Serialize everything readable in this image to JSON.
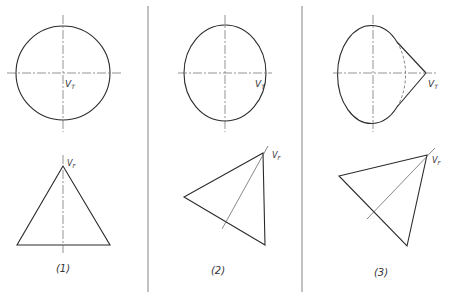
{
  "figure": {
    "type": "technical-projection-diagram",
    "panels": [
      {
        "caption": "(1)",
        "top_view": {
          "shape": "circle",
          "vertex_label": "V",
          "vertex_sub": "T"
        },
        "front_view": {
          "shape": "isosceles-triangle",
          "vertex_label": "V",
          "vertex_sub": "F"
        }
      },
      {
        "caption": "(2)",
        "top_view": {
          "shape": "ellipse",
          "vertex_label": "V",
          "vertex_sub": "T"
        },
        "front_view": {
          "shape": "tilted-triangle",
          "vertex_label": "V",
          "vertex_sub": "F"
        }
      },
      {
        "caption": "(3)",
        "top_view": {
          "shape": "ellipse-with-tangents",
          "vertex_label": "V",
          "vertex_sub": "T"
        },
        "front_view": {
          "shape": "tilted-triangle",
          "vertex_label": "V",
          "vertex_sub": "F"
        }
      }
    ],
    "colors": {
      "line": "#2a2a2a",
      "background": "#ffffff"
    }
  }
}
